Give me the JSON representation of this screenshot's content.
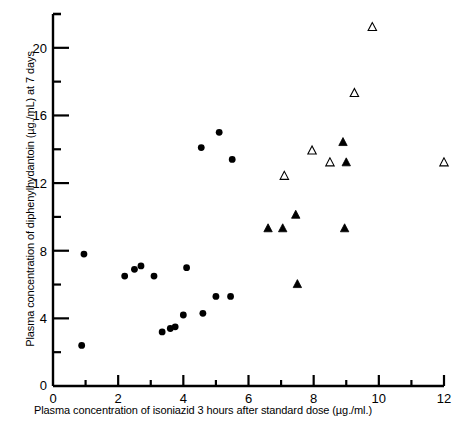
{
  "chart_data": {
    "type": "scatter",
    "title": "",
    "xlabel": "Plasma concentration of isoniazid 3 hours after standard dose (µg./ml.)",
    "ylabel": "Plasma concentration of diphenylhydantoin (µg./mL) at 7 days",
    "xlim": [
      0,
      12
    ],
    "ylim": [
      0,
      22
    ],
    "xticks": [
      0,
      2,
      4,
      6,
      8,
      10,
      12
    ],
    "xtick_labels": [
      "0",
      "2",
      "4",
      "6",
      "8",
      "10",
      "12"
    ],
    "xminorticks": [
      1,
      3,
      5,
      7,
      9,
      11
    ],
    "yticks": [
      0,
      4,
      8,
      12,
      16,
      20
    ],
    "ytick_labels": [
      "0",
      "4",
      "8",
      "12",
      "16",
      "20"
    ],
    "yminorticks": [
      2,
      6,
      10,
      14,
      18,
      22
    ],
    "grid": false,
    "legend_position": "none",
    "marker_color": "#000000",
    "axis_color": "#000000",
    "series": [
      {
        "name": "filled-circle",
        "marker": "circle",
        "fill": "#000000",
        "points": [
          [
            0.95,
            7.8
          ],
          [
            0.88,
            2.4
          ],
          [
            2.2,
            6.5
          ],
          [
            2.5,
            6.9
          ],
          [
            2.7,
            7.1
          ],
          [
            3.1,
            6.5
          ],
          [
            3.35,
            3.2
          ],
          [
            3.6,
            3.4
          ],
          [
            3.75,
            3.5
          ],
          [
            4.0,
            4.2
          ],
          [
            4.1,
            7.0
          ],
          [
            4.55,
            14.1
          ],
          [
            4.6,
            4.3
          ],
          [
            5.0,
            5.3
          ],
          [
            5.1,
            15.0
          ],
          [
            5.45,
            5.3
          ],
          [
            5.5,
            13.4
          ]
        ]
      },
      {
        "name": "open-triangle",
        "marker": "triangle-open",
        "fill": "none",
        "points": [
          [
            7.1,
            12.4
          ],
          [
            7.95,
            13.9
          ],
          [
            8.5,
            13.2
          ],
          [
            9.25,
            17.3
          ],
          [
            9.8,
            21.2
          ],
          [
            12.0,
            13.2
          ]
        ]
      },
      {
        "name": "filled-triangle",
        "marker": "triangle-filled",
        "fill": "#000000",
        "points": [
          [
            6.6,
            9.3
          ],
          [
            7.05,
            9.3
          ],
          [
            7.45,
            10.1
          ],
          [
            7.5,
            6.0
          ],
          [
            8.95,
            9.3
          ],
          [
            8.9,
            14.4
          ],
          [
            9.0,
            13.2
          ]
        ]
      }
    ]
  },
  "axes": {
    "x_title": "Plasma concentration of isoniazid 3 hours after standard dose (µg./ml.)",
    "y_title": "Plasma concentration of diphenylhydantoin (µg./mL) at 7 days",
    "x_zero_label": "0",
    "y_zero_label": "0"
  }
}
